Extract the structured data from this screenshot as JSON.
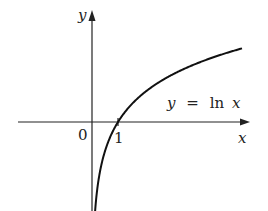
{
  "figure": {
    "function_label": "y = ln x",
    "function_label_parts": {
      "lhs": "y",
      "eq": "=",
      "fn": "ln",
      "arg": "x"
    },
    "x_axis_label": "x",
    "y_axis_label": "y",
    "origin_label": "0",
    "tick_label": "1",
    "colors": {
      "curve": "#111111",
      "axes": "#222222",
      "background": "#ffffff"
    }
  }
}
